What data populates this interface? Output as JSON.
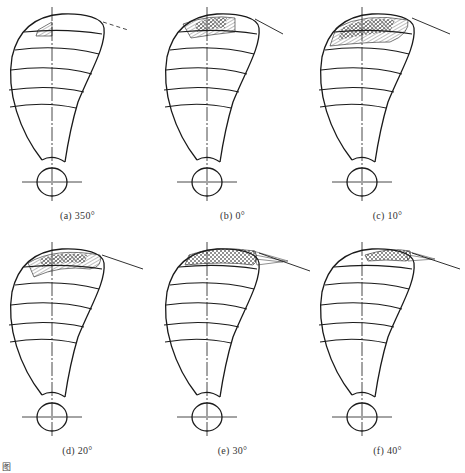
{
  "figure": {
    "panels": [
      {
        "id": "a",
        "caption": "(a) 350°",
        "angle": 350,
        "hatch_rows": 1,
        "hatch_style": "small",
        "tip_line": "dashed"
      },
      {
        "id": "b",
        "caption": "(b) 0°",
        "angle": 0,
        "hatch_rows": 2,
        "hatch_style": "medium",
        "tip_line": "solid"
      },
      {
        "id": "c",
        "caption": "(c) 10°",
        "angle": 10,
        "hatch_rows": 2,
        "hatch_style": "large",
        "tip_line": "solid"
      },
      {
        "id": "d",
        "caption": "(d) 20°",
        "angle": 20,
        "hatch_rows": 2,
        "hatch_style": "large",
        "tip_line": "solid"
      },
      {
        "id": "e",
        "caption": "(e) 30°",
        "angle": 30,
        "hatch_rows": 1,
        "hatch_style": "tip-fan",
        "tip_line": "solid"
      },
      {
        "id": "f",
        "caption": "(f) 40°",
        "angle": 40,
        "hatch_rows": 1,
        "hatch_style": "tip-fan-thin",
        "tip_line": "solid"
      }
    ],
    "footer_fragment": "图"
  },
  "colors": {
    "line": "#1a1a1a",
    "background": "#ffffff"
  }
}
